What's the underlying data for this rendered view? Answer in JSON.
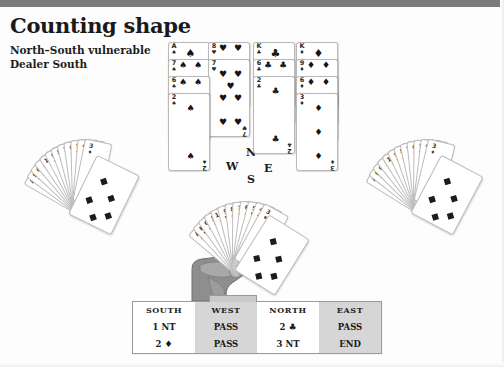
{
  "page": {
    "title": "Counting shape",
    "vulnerability": "North–South vulnerable",
    "dealer": "Dealer South"
  },
  "compass": {
    "north": "N",
    "west": "W",
    "east": "E",
    "south": "S"
  },
  "suits": {
    "spade": "♠",
    "heart": "♥",
    "club": "♣",
    "diamond": "♦"
  },
  "north_hand": {
    "label": "North hand",
    "columns": [
      {
        "suit": "♠",
        "suit_name": "spade",
        "cards": [
          {
            "rank": "A",
            "pips": 1
          },
          {
            "rank": "7",
            "pips": 7
          },
          {
            "rank": "6",
            "pips": 6
          },
          {
            "rank": "2",
            "pips": 2
          }
        ]
      },
      {
        "suit": "♥",
        "suit_name": "heart",
        "cards": [
          {
            "rank": "8",
            "pips": 8
          },
          {
            "rank": "7",
            "pips": 7
          }
        ]
      },
      {
        "suit": "♣",
        "suit_name": "club",
        "cards": [
          {
            "rank": "K",
            "pips": 1
          },
          {
            "rank": "6",
            "pips": 6
          },
          {
            "rank": "2",
            "pips": 2
          }
        ]
      },
      {
        "suit": "♦",
        "suit_name": "diamond",
        "cards": [
          {
            "rank": "K",
            "pips": 1
          },
          {
            "rank": "9",
            "pips": 9
          },
          {
            "rank": "6",
            "pips": 6
          },
          {
            "rank": "3",
            "pips": 3
          }
        ]
      }
    ]
  },
  "west_hand": {
    "label": "West hand",
    "card_count": 13
  },
  "east_hand": {
    "label": "East hand",
    "card_count": 13
  },
  "south_hand": {
    "label": "South hand",
    "card_count": 13
  },
  "bidding": {
    "headers": [
      "SOUTH",
      "WEST",
      "NORTH",
      "EAST"
    ],
    "rows": [
      [
        "1 NT",
        "PASS",
        "2 ♣",
        "PASS"
      ],
      [
        "2 ♦",
        "PASS",
        "3 NT",
        "END"
      ]
    ],
    "shaded_columns": [
      1,
      3
    ]
  },
  "colors": {
    "rule": "#7b7b7b",
    "shade": "#d6d6d6",
    "ink": "#1a1a1a"
  }
}
